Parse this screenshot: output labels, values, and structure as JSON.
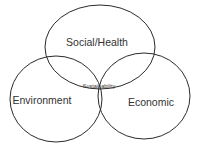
{
  "diagram": {
    "type": "venn",
    "sets": [
      {
        "id": "social",
        "label": "Social/Health",
        "cx": 100,
        "cy": 47,
        "rx": 55,
        "ry": 42
      },
      {
        "id": "environment",
        "label": "Environment",
        "cx": 56,
        "cy": 99,
        "rx": 46,
        "ry": 43
      },
      {
        "id": "economic",
        "label": "Economic",
        "cx": 144,
        "cy": 96,
        "rx": 46,
        "ry": 43
      }
    ],
    "intersection_label": "Sustainability",
    "stroke_color": "#222222"
  }
}
